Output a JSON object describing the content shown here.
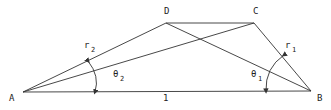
{
  "diagram": {
    "points": {
      "A": {
        "label": "A",
        "x": 23,
        "y": 92
      },
      "B": {
        "label": "B",
        "x": 311,
        "y": 91
      },
      "C": {
        "label": "C",
        "x": 254,
        "y": 23
      },
      "D": {
        "label": "D",
        "x": 166,
        "y": 23
      }
    },
    "base_length_label": "1",
    "angles": {
      "theta1": {
        "symbol": "θ",
        "sub": "1"
      },
      "theta2": {
        "symbol": "θ",
        "sub": "2"
      }
    },
    "radii": {
      "r1": {
        "symbol": "r",
        "sub": "1"
      },
      "r2": {
        "symbol": "r",
        "sub": "2"
      }
    },
    "line_color": "#333333"
  }
}
